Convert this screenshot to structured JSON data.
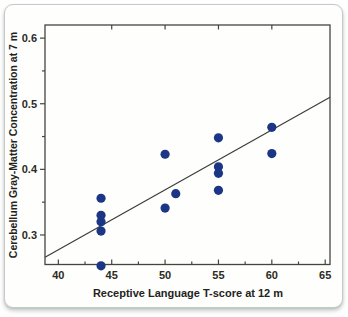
{
  "chart_data": {
    "type": "scatter",
    "title": "",
    "xlabel": "Receptive Language T-score at 12 m",
    "ylabel": "Cerebellum Gray-Matter Concentration at 7 m",
    "xlim": [
      38.75,
      65.45
    ],
    "ylim": [
      0.255,
      0.62
    ],
    "x_major_ticks": [
      40,
      45,
      50,
      55,
      60,
      65
    ],
    "x_tick_labels": [
      "40",
      "45",
      "50",
      "55",
      "60",
      "65"
    ],
    "x_minor_ticks": [
      42.5,
      47.5,
      52.5,
      57.5,
      62.5
    ],
    "top_edge_ticks": [
      45,
      50,
      55,
      60
    ],
    "y_major_ticks": [
      0.3,
      0.4,
      0.5,
      0.6
    ],
    "y_tick_labels": [
      "0.3",
      "0.4",
      "0.5",
      "0.6"
    ],
    "y_minor_ticks": [
      0.35,
      0.45,
      0.55
    ],
    "grid": false,
    "legend": null,
    "points": [
      [
        44,
        0.356
      ],
      [
        44,
        0.33
      ],
      [
        44,
        0.32
      ],
      [
        44,
        0.306
      ],
      [
        44,
        0.253
      ],
      [
        50,
        0.423
      ],
      [
        50,
        0.341
      ],
      [
        51,
        0.363
      ],
      [
        55,
        0.448
      ],
      [
        55,
        0.404
      ],
      [
        55,
        0.394
      ],
      [
        55,
        0.368
      ],
      [
        60,
        0.464
      ],
      [
        60,
        0.424
      ]
    ],
    "trend_line": {
      "x1": 38.75,
      "y1": 0.266,
      "x2": 65.45,
      "y2": 0.51
    },
    "colors": {
      "point": "#1b3685",
      "trend_line": "#3d3d3a",
      "axis": "#45453f",
      "text": "#2b2b24"
    }
  }
}
